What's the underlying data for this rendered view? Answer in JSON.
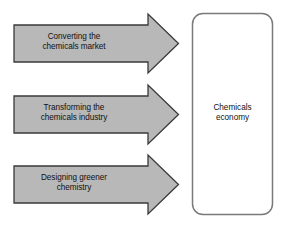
{
  "diagram": {
    "type": "process-flow",
    "title": "",
    "colors": {
      "arrow_fill": "#b8b8b8",
      "arrow_stroke": "#3a3a3a",
      "box_fill": "#ffffff",
      "box_stroke": "#7a7a7a",
      "text": "#111111",
      "background": "#ffffff"
    },
    "arrows": [
      {
        "id": "arrow-converting",
        "label": "Converting the\nchemicals market",
        "line1": "Converting the",
        "line2": "chemicals market",
        "direction": "right"
      },
      {
        "id": "arrow-transforming",
        "label": "Transforming the\nchemicals industry",
        "line1": "Transforming the",
        "line2": "chemicals industry",
        "direction": "right"
      },
      {
        "id": "arrow-designing",
        "label": "Designing greener\nchemistry",
        "line1": "Designing greener",
        "line2": "chemistry",
        "direction": "right"
      }
    ],
    "target_box": {
      "id": "box-chemicals-economy",
      "label": "Chemicals\neconomy",
      "line1": "Chemicals",
      "line2": "economy"
    }
  }
}
